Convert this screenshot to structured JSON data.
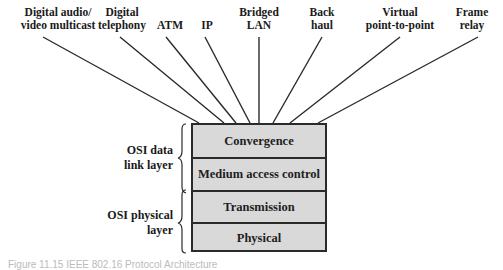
{
  "protocols": [
    {
      "line1": "Digital audio/",
      "line2": "video multicast",
      "cx": 58
    },
    {
      "line1": "Digital",
      "line2": "telephony",
      "cx": 122
    },
    {
      "line1": "",
      "line2": "ATM",
      "cx": 170
    },
    {
      "line1": "",
      "line2": "IP",
      "cx": 207
    },
    {
      "line1": "Bridged",
      "line2": "LAN",
      "cx": 259
    },
    {
      "line1": "Back",
      "line2": "haul",
      "cx": 322
    },
    {
      "line1": "Virtual",
      "line2": "point-to-point",
      "cx": 400
    },
    {
      "line1": "Frame",
      "line2": "relay",
      "cx": 472
    }
  ],
  "stack": {
    "layers": [
      "Convergence",
      "Medium access control",
      "Transmission",
      "Physical"
    ]
  },
  "osi_groups": [
    {
      "line1": "OSI data",
      "line2": "link layer"
    },
    {
      "line1": "OSI physical",
      "line2": "layer"
    }
  ],
  "caption": "Figure 11.15   IEEE 802.16 Protocol Architecture",
  "colors": {
    "layer_fill": "#d9d9d9",
    "stroke": "#2a2a2a"
  }
}
